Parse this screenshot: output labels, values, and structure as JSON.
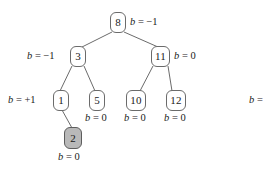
{
  "diagram": {
    "type": "binary-search-tree",
    "colors": {
      "node_fill": "#ffffff",
      "node_stroke": "#6b6b6b",
      "shaded_node_fill": "#b9b9b9",
      "edge_stroke": "#6b6b6b",
      "text": "#1a1a1a"
    },
    "nodes": [
      {
        "id": "n8",
        "key": "8",
        "x": 110,
        "y": 12,
        "w": 16,
        "h": 21,
        "shaded": false
      },
      {
        "id": "n3",
        "key": "3",
        "x": 70,
        "y": 46,
        "w": 16,
        "h": 21,
        "shaded": false
      },
      {
        "id": "n11",
        "key": "11",
        "x": 151,
        "y": 46,
        "w": 19,
        "h": 21,
        "shaded": false
      },
      {
        "id": "n1",
        "key": "1",
        "x": 53,
        "y": 90,
        "w": 16,
        "h": 21,
        "shaded": false
      },
      {
        "id": "n5",
        "key": "5",
        "x": 89,
        "y": 90,
        "w": 16,
        "h": 21,
        "shaded": false
      },
      {
        "id": "n10",
        "key": "10",
        "x": 126,
        "y": 90,
        "w": 20,
        "h": 21,
        "shaded": false
      },
      {
        "id": "n12",
        "key": "12",
        "x": 166,
        "y": 90,
        "w": 20,
        "h": 21,
        "shaded": false
      },
      {
        "id": "n2",
        "key": "2",
        "x": 64,
        "y": 127,
        "w": 18,
        "h": 22,
        "shaded": true
      }
    ],
    "edges": [
      {
        "from": "n8",
        "to": "n3",
        "x1": 112,
        "y1": 32,
        "x2": 82,
        "y2": 47
      },
      {
        "from": "n8",
        "to": "n11",
        "x1": 124,
        "y1": 32,
        "x2": 158,
        "y2": 47
      },
      {
        "from": "n3",
        "to": "n1",
        "x1": 72,
        "y1": 66,
        "x2": 60,
        "y2": 91
      },
      {
        "from": "n3",
        "to": "n5",
        "x1": 84,
        "y1": 66,
        "x2": 95,
        "y2": 91
      },
      {
        "from": "n11",
        "to": "n10",
        "x1": 153,
        "y1": 66,
        "x2": 140,
        "y2": 91
      },
      {
        "from": "n11",
        "to": "n12",
        "x1": 168,
        "y1": 66,
        "x2": 172,
        "y2": 91
      },
      {
        "from": "n1",
        "to": "n2",
        "x1": 62,
        "y1": 110,
        "x2": 72,
        "y2": 128
      }
    ],
    "balance_labels": [
      {
        "id": "b8",
        "node": "n8",
        "var": "b",
        "op": "=",
        "value": "−1",
        "text": "b = −1",
        "x": 130,
        "y": 17
      },
      {
        "id": "b3",
        "node": "n3",
        "var": "b",
        "op": "=",
        "value": "−1",
        "text": "b = −1",
        "x": 27,
        "y": 51
      },
      {
        "id": "b11",
        "node": "n11",
        "var": "b",
        "op": "=",
        "value": "0",
        "text": "b = 0",
        "x": 174,
        "y": 51
      },
      {
        "id": "b1",
        "node": "n1",
        "var": "b",
        "op": "=",
        "value": "+1",
        "text": "b = +1",
        "x": 8,
        "y": 95
      },
      {
        "id": "b5",
        "node": "n5",
        "var": "b",
        "op": "=",
        "value": "0",
        "text": "b = 0",
        "x": 85,
        "y": 113
      },
      {
        "id": "b10",
        "node": "n10",
        "var": "b",
        "op": "=",
        "value": "0",
        "text": "b = 0",
        "x": 124,
        "y": 113
      },
      {
        "id": "b12",
        "node": "n12",
        "var": "b",
        "op": "=",
        "value": "0",
        "text": "b = 0",
        "x": 164,
        "y": 113
      },
      {
        "id": "b2",
        "node": "n2",
        "var": "b",
        "op": "=",
        "value": "0",
        "text": "b = 0",
        "x": 58,
        "y": 152
      },
      {
        "id": "bcut",
        "node": null,
        "var": "b",
        "op": "=",
        "value": "",
        "text": "b =",
        "x": 249,
        "y": 95
      }
    ]
  }
}
